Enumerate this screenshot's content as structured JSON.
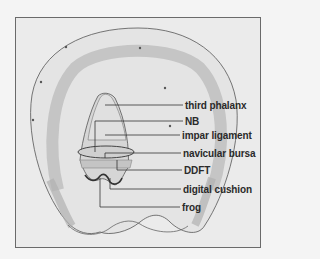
{
  "figure": {
    "labels": [
      {
        "text": "third phalanx",
        "x": 185,
        "y": 100
      },
      {
        "text": "NB",
        "x": 185,
        "y": 116
      },
      {
        "text": "impar ligament",
        "x": 182,
        "y": 130
      },
      {
        "text": "navicular bursa",
        "x": 183,
        "y": 148
      },
      {
        "text": "DDFT",
        "x": 184,
        "y": 165
      },
      {
        "text": "digital cushion",
        "x": 183,
        "y": 184
      },
      {
        "text": "frog",
        "x": 182,
        "y": 202
      }
    ],
    "colors": {
      "background": "#ebebeb",
      "frame": "#6a6a6a",
      "line": "#333333",
      "shading": "#b8b8b8",
      "text": "#2a2a2a"
    }
  }
}
